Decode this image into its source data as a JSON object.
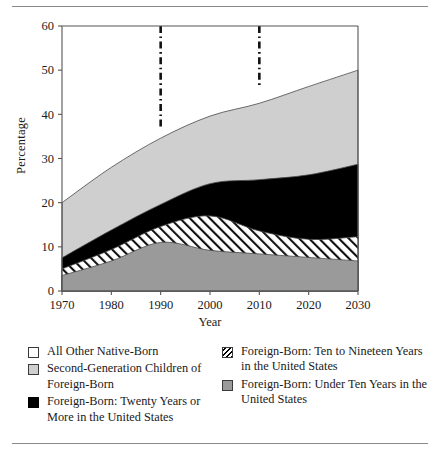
{
  "chart_data": {
    "type": "area",
    "stacked": true,
    "title": "",
    "xlabel": "Year",
    "ylabel": "Percentage",
    "x": [
      1970,
      1980,
      1990,
      2000,
      2010,
      2020,
      2030
    ],
    "xlim": [
      1970,
      2030
    ],
    "ylim": [
      0,
      60
    ],
    "xticks": [
      "1970",
      "1980",
      "1990",
      "2000",
      "2010",
      "2020",
      "2030"
    ],
    "yticks": [
      "0",
      "10",
      "20",
      "30",
      "40",
      "50",
      "60"
    ],
    "grid": false,
    "legend_position": "below",
    "series": [
      {
        "name": "Foreign-Born: Under Ten Years in the United States",
        "fill": "#9a9a9a",
        "pattern": "solid",
        "values": [
          3.5,
          6.8,
          11.0,
          9.2,
          8.4,
          7.6,
          6.8
        ]
      },
      {
        "name": "Foreign-Born: Ten to Nineteen Years in the United States",
        "fill": "#ffffff",
        "pattern": "diagonal-hatch",
        "values": [
          1.5,
          2.6,
          3.6,
          7.8,
          5.2,
          4.1,
          5.5
        ]
      },
      {
        "name": "Foreign-Born: Twenty Years or More in the United States",
        "fill": "#000000",
        "pattern": "solid",
        "values": [
          2.5,
          4.4,
          5.0,
          7.3,
          11.6,
          14.6,
          16.4
        ]
      },
      {
        "name": "Second-Generation Children of Foreign-Born",
        "fill": "#cfcfcf",
        "pattern": "solid",
        "values": [
          12.5,
          14.2,
          15.0,
          15.3,
          17.3,
          19.0,
          21.3
        ]
      }
    ],
    "cumulative_tops": {
      "under_ten": [
        3.5,
        6.8,
        11.0,
        9.2,
        8.4,
        7.6,
        6.8
      ],
      "ten_to_nineteen": [
        5.0,
        9.4,
        14.6,
        17.0,
        13.6,
        11.7,
        12.3
      ],
      "twenty_or_more": [
        7.5,
        13.8,
        19.6,
        24.3,
        25.2,
        26.3,
        28.7
      ],
      "second_generation": [
        20.0,
        28.0,
        34.6,
        39.6,
        42.5,
        46.3,
        50.0
      ]
    },
    "annotations": [
      {
        "type": "vertical-dash-dot-line",
        "x": 1990,
        "y_from": 60,
        "y_to": 36.5
      },
      {
        "type": "vertical-dash-dot-line",
        "x": 2010,
        "y_from": 60,
        "y_to": 46.5
      }
    ]
  },
  "axes": {
    "y_title": "Percentage",
    "x_title": "Year"
  },
  "legend": {
    "left_items": [
      {
        "swatch": "white-outline-swatch",
        "label": "All Other Native-Born"
      },
      {
        "swatch": "light-gray-swatch",
        "label": "Second-Generation Children of Foreign-Born"
      },
      {
        "swatch": "black-swatch",
        "label": "Foreign-Born: Twenty Years or More in the United States"
      }
    ],
    "right_items": [
      {
        "swatch": "hatched-swatch",
        "label": "Foreign-Born: Ten to Nineteen Years in the United States"
      },
      {
        "swatch": "mid-gray-swatch",
        "label": "Foreign-Born: Under Ten Years in the United States"
      }
    ]
  },
  "colors": {
    "all_other_native_born": "#ffffff",
    "second_generation": "#cfcfcf",
    "twenty_or_more": "#000000",
    "ten_to_nineteen": "#ffffff",
    "under_ten": "#9a9a9a",
    "axis": "#555555",
    "rule": "#8a8a8a"
  }
}
